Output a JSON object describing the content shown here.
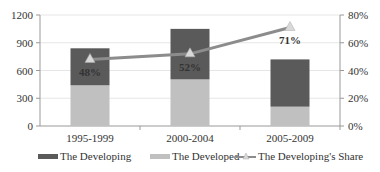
{
  "chart_data": {
    "type": "bar",
    "stacked": true,
    "title": "",
    "xlabel": "",
    "ylabel": "",
    "categories": [
      "1995-1999",
      "2000-2004",
      "2005-2009"
    ],
    "series": [
      {
        "name": "The Developed",
        "type": "bar",
        "axis": "left",
        "color": "#c0c0c0",
        "values": [
          440,
          504,
          209
        ]
      },
      {
        "name": "The Developing",
        "type": "bar",
        "axis": "left",
        "color": "#5a5a5a",
        "values": [
          400,
          546,
          511
        ]
      },
      {
        "name": "The Developing's Share",
        "type": "line",
        "axis": "right",
        "color": "#8c8c8c",
        "marker": "triangle",
        "values": [
          48,
          52,
          71
        ],
        "labels": [
          "48%",
          "52%",
          "71%"
        ]
      }
    ],
    "ylim": [
      0,
      1200
    ],
    "yticks": [
      0,
      300,
      600,
      900,
      1200
    ],
    "y2lim": [
      0,
      80
    ],
    "y2ticks": [
      "0%",
      "20%",
      "40%",
      "60%",
      "80%"
    ],
    "grid": true,
    "legend_position": "bottom",
    "legend": [
      "The Developing",
      "The Developed",
      "The Developing's Share"
    ]
  }
}
